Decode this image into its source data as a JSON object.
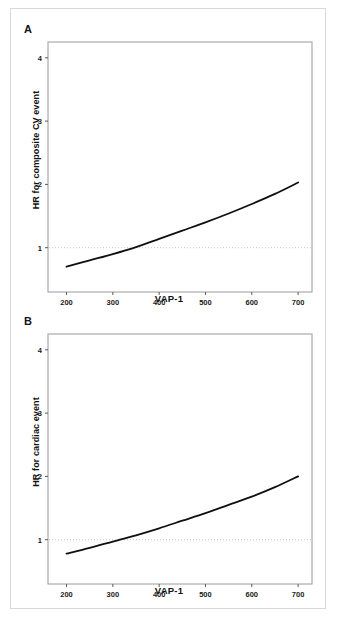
{
  "figure": {
    "panels": [
      {
        "letter": "A",
        "ylabel": "HR for composite CV event",
        "xlabel": "VAP-1"
      },
      {
        "letter": "B",
        "ylabel": "HR for cardiac event",
        "xlabel": "VAP-1"
      }
    ]
  },
  "chart_data": [
    {
      "type": "line",
      "panel": "A",
      "title": "",
      "xlabel": "VAP-1",
      "ylabel": "HR for composite CV event",
      "xlim": [
        160,
        730
      ],
      "ylim": [
        0.3,
        4.25
      ],
      "xticks": [
        200,
        300,
        400,
        500,
        600,
        700
      ],
      "xtick_labels": [
        "200",
        "300",
        "400",
        "500",
        "600",
        "700"
      ],
      "yticks": [
        1,
        2,
        3,
        4
      ],
      "ytick_labels": [
        "1",
        "2",
        "3",
        "4"
      ],
      "grid": false,
      "legend": "none",
      "reference_line": {
        "y": 1,
        "style": "dotted",
        "color": "#c8c8c8"
      },
      "series": [
        {
          "name": "Hazard ratio",
          "color": "#101010",
          "x": [
            200,
            250,
            300,
            350,
            400,
            450,
            500,
            550,
            600,
            650,
            700
          ],
          "y": [
            0.7,
            0.8,
            0.9,
            1.01,
            1.14,
            1.27,
            1.4,
            1.54,
            1.69,
            1.85,
            2.03
          ]
        }
      ]
    },
    {
      "type": "line",
      "panel": "B",
      "title": "",
      "xlabel": "VAP-1",
      "ylabel": "HR for cardiac event",
      "xlim": [
        160,
        730
      ],
      "ylim": [
        0.3,
        4.25
      ],
      "xticks": [
        200,
        300,
        400,
        500,
        600,
        700
      ],
      "xtick_labels": [
        "200",
        "300",
        "400",
        "500",
        "600",
        "700"
      ],
      "yticks": [
        1,
        2,
        3,
        4
      ],
      "ytick_labels": [
        "1",
        "2",
        "3",
        "4"
      ],
      "grid": false,
      "legend": "none",
      "reference_line": {
        "y": 1,
        "style": "dotted",
        "color": "#c8c8c8"
      },
      "series": [
        {
          "name": "Hazard ratio",
          "color": "#101010",
          "x": [
            200,
            250,
            300,
            350,
            400,
            450,
            500,
            550,
            600,
            650,
            700
          ],
          "y": [
            0.78,
            0.87,
            0.97,
            1.07,
            1.18,
            1.3,
            1.42,
            1.55,
            1.68,
            1.83,
            2.0
          ]
        }
      ]
    }
  ]
}
